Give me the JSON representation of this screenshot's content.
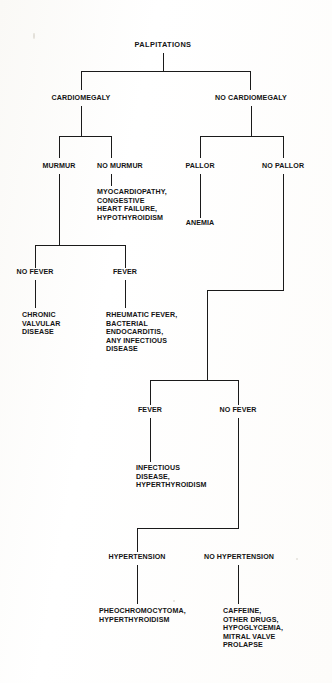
{
  "diagram": {
    "title": "PALPITATIONS",
    "type": "clinical decision tree",
    "root": "PALPITATIONS",
    "nodes": {
      "palpitations": "PALPITATIONS",
      "cardiomegaly": "CARDIOMEGALY",
      "no_cardiomegaly": "NO CARDIOMEGALY",
      "murmur": "MURMUR",
      "no_murmur": "NO MURMUR",
      "pallor": "PALLOR",
      "no_pallor": "NO PALLOR",
      "myocardiopathy_block": "MYOCARDIOPATHY,\nCONGESTIVE\nHEART FAILURE,\nHYPOTHYROIDISM",
      "anemia": "ANEMIA",
      "no_fever_1": "NO FEVER",
      "fever_1": "FEVER",
      "chronic_valvular": "CHRONIC\nVALVULAR\nDISEASE",
      "rheumatic_block": "RHEUMATIC FEVER,\nBACTERIAL\nENDOCARDITIS,\nANY INFECTIOUS\nDISEASE",
      "fever_2": "FEVER",
      "no_fever_2": "NO FEVER",
      "infectious_block": "INFECTIOUS\nDISEASE,\nHYPERTHYROIDISM",
      "hypertension": "HYPERTENSION",
      "no_hypertension": "NO HYPERTENSION",
      "pheochromocytoma_block": "PHEOCHROMOCYTOMA,\nHYPERTHYROIDISM",
      "caffeine_block": "CAFFEINE,\nOTHER DRUGS,\nHYPOGLYCEMIA,\nMITRAL VALVE\nPROLAPSE"
    },
    "colors": {
      "line": "#1a1a1a",
      "text": "#141414",
      "background": "#ffffff"
    }
  }
}
